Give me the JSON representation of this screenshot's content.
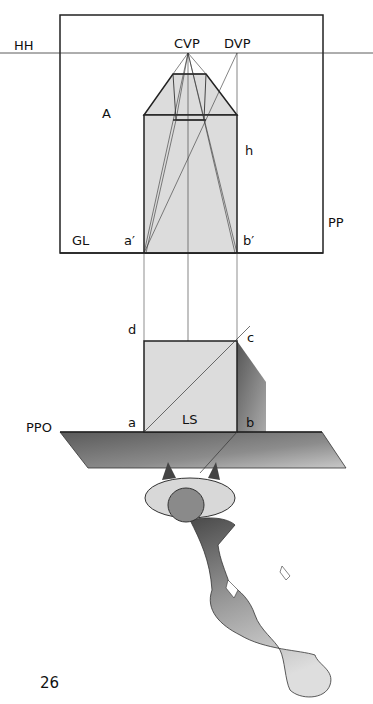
{
  "figure": {
    "labels": {
      "hh": "HH",
      "cvp": "CVP",
      "dvp": "DVP",
      "a_upper": "A",
      "h": "h",
      "pp": "PP",
      "gl": "GL",
      "a_prime": "a′",
      "b_prime": "b′",
      "d": "d",
      "c": "c",
      "a": "a",
      "ls": "LS",
      "b": "b",
      "ppo": "PPO"
    },
    "page_number": "26",
    "colors": {
      "line": "#222222",
      "fill_light": "#dcdcdc",
      "shade_dark": "#6a6a6a",
      "shade_mid": "#9a9a9a"
    }
  }
}
